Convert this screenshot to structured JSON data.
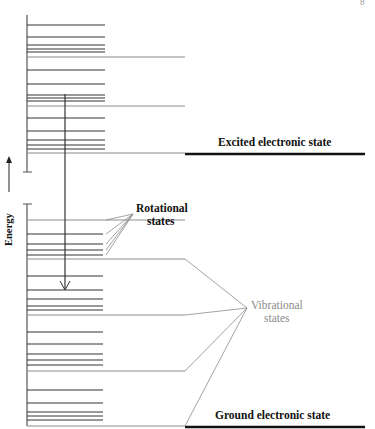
{
  "page_number_fragment": "8",
  "colors": {
    "line_dark": "#333333",
    "line_gray": "#8c8c8c",
    "thick_state": "#111111",
    "vibrational_label": "#8a8a8a"
  },
  "labels": {
    "energy_axis": "Energy",
    "excited_state": "Excited electronic state",
    "ground_state": "Ground electronic state",
    "rotational_line1": "Rotational",
    "rotational_line2": "states",
    "vibrational_line1": "Vibrational",
    "vibrational_line2": "states"
  },
  "excited_manifold": {
    "bracket_top": 15,
    "bracket_bottom": 172,
    "rotational_levels_y": [
      25,
      37,
      45,
      49,
      52,
      70,
      84,
      95,
      98,
      101,
      118,
      131,
      140,
      145,
      149
    ],
    "vibrational_levels_y": [
      57,
      106,
      153
    ]
  },
  "ground_manifold": {
    "bracket_top": 204,
    "bracket_bottom": 426,
    "rotational_levels_y": [
      234,
      244,
      250,
      255,
      276,
      290,
      299,
      306,
      310,
      332,
      344,
      354,
      360,
      365,
      390,
      403,
      412,
      416,
      420
    ],
    "vibrational_levels_y": [
      220,
      259,
      315,
      371,
      426
    ]
  },
  "transition_arrow": {
    "x": 65,
    "y_start": 94,
    "y_end": 290
  },
  "rotational_pointer": {
    "apex": [
      133,
      214
    ],
    "targets_y": [
      220,
      234,
      244,
      250,
      255
    ]
  },
  "vibrational_pointer": {
    "apex": [
      247,
      308
    ],
    "targets_y": [
      259,
      315,
      371,
      426
    ]
  }
}
